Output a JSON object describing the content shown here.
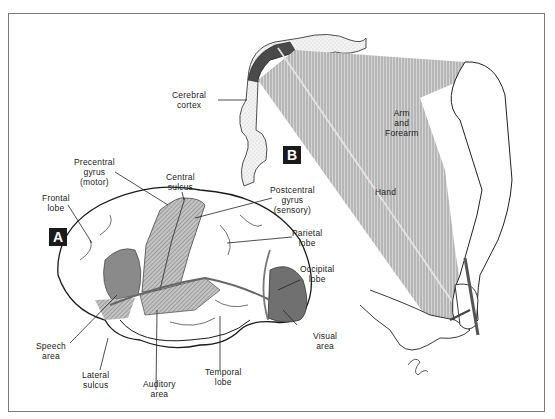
{
  "figure": {
    "panels": [
      {
        "id": "A",
        "badge": "A"
      },
      {
        "id": "B",
        "badge": "B"
      }
    ],
    "labels": {
      "cerebral_cortex": "Cerebral\ncortex",
      "precentral_gyrus": "Precentral\ngyrus\n(motor)",
      "central_sulcus": "Central\nsulcus",
      "frontal_lobe": "Frontal\nlobe",
      "postcentral_gyrus": "Postcentral\ngyrus\n(sensory)",
      "parietal_lobe": "Parietal\nlobe",
      "occipital_lobe": "Occipital\nlobe",
      "visual_area": "Visual\narea",
      "speech_area": "Speech\narea",
      "lateral_sulcus": "Lateral\nsulcus",
      "auditory_area": "Auditory\narea",
      "temporal_lobe": "Temporal\nlobe",
      "arm_and_forearm": "Arm\nand\nForearm",
      "hand": "Hand"
    },
    "colors": {
      "ink": "#1a1a1a",
      "shade": "#8c8c8c",
      "dark_shade": "#555555",
      "hatch": "#b5b5b5",
      "frame": "#7a7a7a"
    }
  }
}
